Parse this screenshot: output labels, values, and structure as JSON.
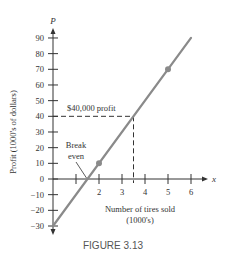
{
  "chart_data": {
    "type": "line",
    "title": "FIGURE 3.13",
    "xlabel": "Number of tires sold (1000's)",
    "xlabel_lines": [
      "Number of tires sold",
      "(1000's)"
    ],
    "ylabel": "Profit (1000's of dollars)",
    "x_axis_symbol": "x",
    "y_axis_symbol": "P",
    "xlim": [
      0,
      6
    ],
    "ylim": [
      -30,
      90
    ],
    "x_ticks": [
      1,
      2,
      3,
      4,
      5,
      6
    ],
    "x_tick_labels": [
      "",
      "2",
      "3",
      "4",
      "5",
      "6"
    ],
    "y_ticks": [
      90,
      80,
      70,
      60,
      50,
      40,
      30,
      20,
      10,
      0,
      -10,
      -20,
      -30
    ],
    "y_tick_labels": [
      "90",
      "80",
      "70",
      "60",
      "50",
      "40",
      "30",
      "20",
      "10",
      "0",
      "−10",
      "−20",
      "−30"
    ],
    "grid": false,
    "series": [
      {
        "name": "Profit",
        "equation": "P = 20x - 30",
        "x": [
          0,
          6
        ],
        "values": [
          -30,
          90
        ],
        "color": "#8a8a8a"
      }
    ],
    "marked_points": [
      {
        "x": 2,
        "y": 10
      },
      {
        "x": 5,
        "y": 70
      }
    ],
    "annotations": [
      {
        "text": "$40,000 profit",
        "x": 3.5,
        "y": 40,
        "style": "dashed guide lines"
      },
      {
        "text": "Break even",
        "text_lines": [
          "Break",
          "even"
        ],
        "x": 1.5,
        "y": 0
      }
    ]
  },
  "figure": {
    "caption": "FIGURE 3.13"
  }
}
